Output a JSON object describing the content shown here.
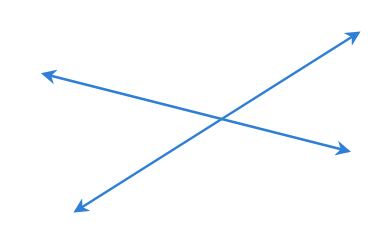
{
  "diagram": {
    "title": "",
    "background": "#ffffff",
    "color": "#2f7fd6",
    "stroke_width": 2.5,
    "lines": [
      {
        "name": "line-a",
        "x1": 44,
        "y1": 74,
        "x2": 348,
        "y2": 151,
        "arrow_start": true,
        "arrow_end": true
      },
      {
        "name": "line-b",
        "x1": 76,
        "y1": 211,
        "x2": 358,
        "y2": 33,
        "arrow_start": true,
        "arrow_end": true
      }
    ],
    "intersection": {
      "x": 220,
      "y": 119
    }
  }
}
